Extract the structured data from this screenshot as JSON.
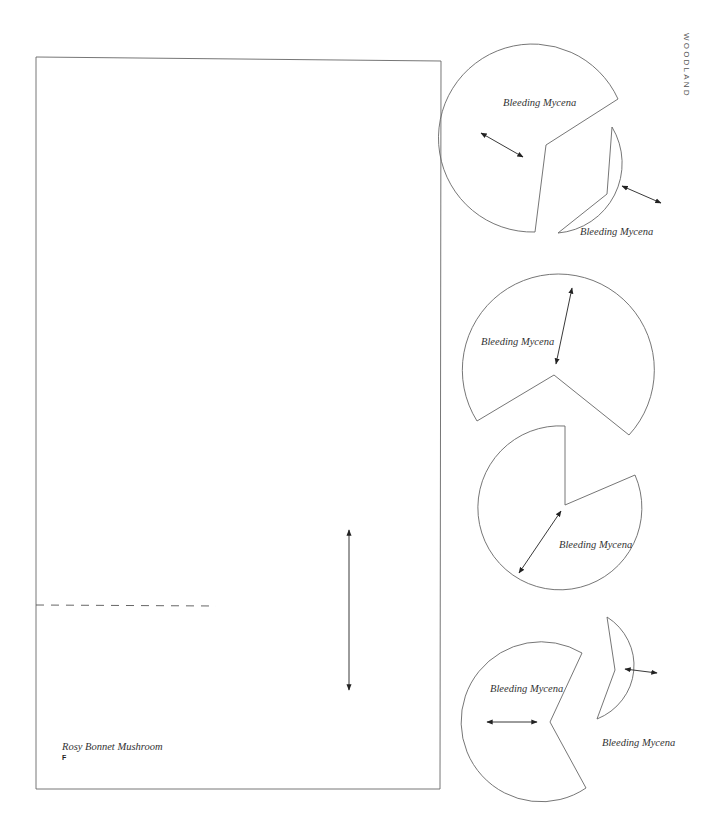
{
  "side_label": "WOODLAND",
  "main_piece": {
    "name": "Rosy Bonnet Mushroom",
    "letter": "F"
  },
  "pieces": [
    {
      "label": "Bleeding Mycena"
    },
    {
      "label": "Bleeding Mycena"
    },
    {
      "label": "Bleeding Mycena"
    },
    {
      "label": "Bleeding Mycena"
    },
    {
      "label": "Bleeding Mycena"
    },
    {
      "label": "Bleeding Mycena"
    }
  ],
  "colors": {
    "outline": "#666666",
    "arrow": "#222222",
    "background": "#ffffff"
  }
}
